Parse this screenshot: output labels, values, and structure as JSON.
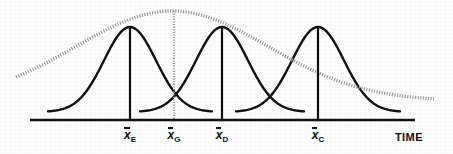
{
  "figure": {
    "kind": "statistical-process-diagram",
    "background_color": "#fdfdfd",
    "ink_color": "#111111",
    "envelope_color": "#999999"
  },
  "axis": {
    "name": "time-axis",
    "label": "TIME",
    "label_x": 395,
    "label_y": 131,
    "x_start": 30,
    "x_end": 415,
    "y": 120,
    "stroke_width": 2.6
  },
  "tick_labels": [
    {
      "id": "xbar-e",
      "symbol": "x",
      "subscript": "E",
      "x": 130,
      "y": 127
    },
    {
      "id": "xbar-g",
      "symbol": "x",
      "subscript": "G",
      "x": 174,
      "y": 127
    },
    {
      "id": "xbar-d",
      "symbol": "x",
      "subscript": "D",
      "x": 222,
      "y": 127
    },
    {
      "id": "xbar-c",
      "symbol": "x",
      "subscript": "C",
      "x": 318,
      "y": 127
    }
  ],
  "chart_data": {
    "type": "line",
    "title": "",
    "xlabel": "TIME",
    "ylabel": "",
    "grid": false,
    "legend": null,
    "xlim": [
      0,
      453
    ],
    "ylim": [
      120,
      0
    ],
    "baseline_y": 120,
    "series": [
      {
        "name": "distribution-E",
        "style": "solid-black",
        "color": "#111111",
        "stroke_width": 2.4,
        "mean_x": 130,
        "peak_y": 27,
        "sigma": 26,
        "tail_y": 112,
        "x_from": 48,
        "x_to": 212
      },
      {
        "name": "distribution-D",
        "style": "solid-black",
        "color": "#111111",
        "stroke_width": 2.4,
        "mean_x": 222,
        "peak_y": 27,
        "sigma": 26,
        "tail_y": 112,
        "x_from": 140,
        "x_to": 304
      },
      {
        "name": "distribution-C",
        "style": "solid-black",
        "color": "#111111",
        "stroke_width": 2.4,
        "mean_x": 318,
        "peak_y": 27,
        "sigma": 26,
        "tail_y": 112,
        "x_from": 236,
        "x_to": 400
      },
      {
        "name": "envelope-G",
        "style": "dotted-gray",
        "color": "#999999",
        "stroke_width": 3.4,
        "mean_x": 172,
        "peak_y": 11,
        "sigma": 96,
        "tail_y": 101,
        "x_from": 16,
        "x_to": 434
      }
    ],
    "verticals": [
      {
        "name": "mean-line-E",
        "x": 130,
        "y_top": 27,
        "y_bottom": 120,
        "style": "solid-black",
        "color": "#111111",
        "stroke_width": 2.2
      },
      {
        "name": "mean-line-G",
        "x": 174,
        "y_top": 11,
        "y_bottom": 120,
        "style": "dotted-gray",
        "color": "#999999",
        "stroke_width": 2.2
      },
      {
        "name": "mean-line-D",
        "x": 222,
        "y_top": 27,
        "y_bottom": 120,
        "style": "solid-black",
        "color": "#111111",
        "stroke_width": 2.2
      },
      {
        "name": "mean-line-C",
        "x": 318,
        "y_top": 27,
        "y_bottom": 120,
        "style": "solid-black",
        "color": "#111111",
        "stroke_width": 2.2
      }
    ]
  }
}
